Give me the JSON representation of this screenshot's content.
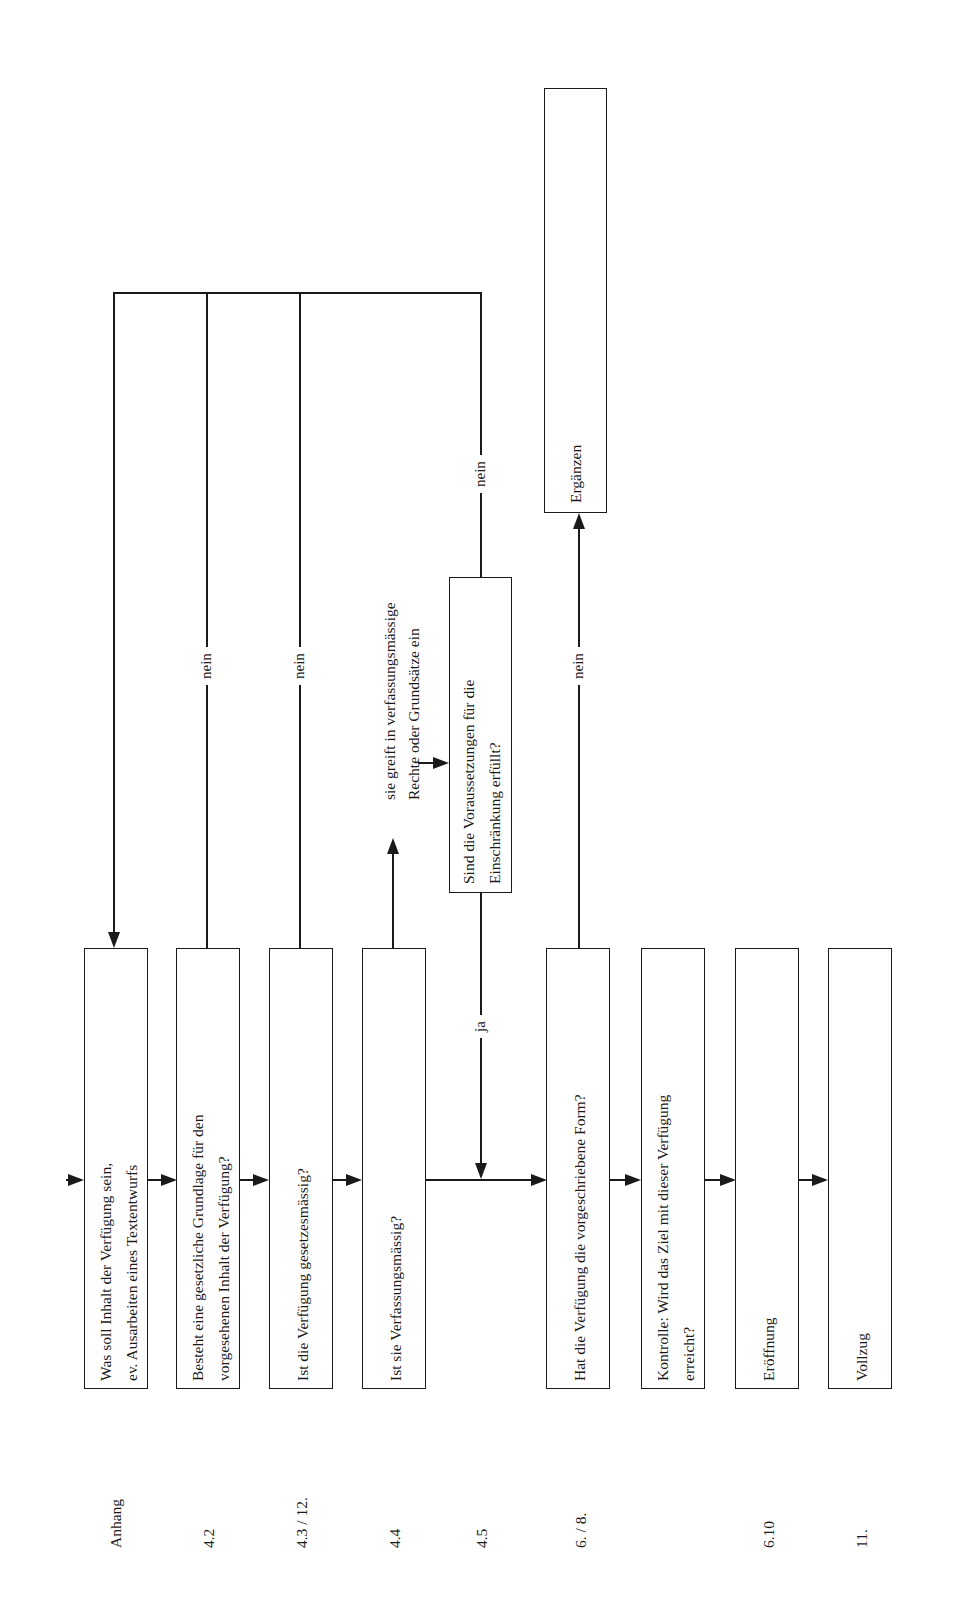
{
  "diagram": {
    "orientation": "rotated-90-ccw",
    "steps": [
      {
        "id": "step1",
        "ref": "Anhang",
        "lines": [
          "Was soll Inhalt der Verfügung sein,",
          "ev. Ausarbeiten eines Textentwurfs"
        ]
      },
      {
        "id": "step2",
        "ref": "4.2",
        "lines": [
          "Besteht eine gesetzliche Grundlage für den",
          "vorgesehenen Inhalt der Verfügung?"
        ]
      },
      {
        "id": "step3",
        "ref": "4.3 / 12.",
        "lines": [
          "Ist die Verfügung gesetzesmässig?"
        ]
      },
      {
        "id": "step4",
        "ref": "4.4",
        "lines": [
          "Ist sie Verfassungsmässig?"
        ]
      },
      {
        "id": "step5",
        "ref": "4.5",
        "lines": []
      },
      {
        "id": "step6",
        "ref": "6. / 8.",
        "lines": [
          "Hat die Verfügung die vorgeschriebene Form?"
        ]
      },
      {
        "id": "step7",
        "ref": "",
        "lines": [
          "Kontrolle: Wird das Ziel mit dieser Verfügung",
          "erreicht?"
        ]
      },
      {
        "id": "step8",
        "ref": "6.10",
        "lines": [
          "Eröffnung"
        ]
      },
      {
        "id": "step9",
        "ref": "11.",
        "lines": [
          "Vollzug"
        ]
      }
    ],
    "side_boxes": {
      "voraussetzungen": {
        "lines": [
          "Sind die Voraussetzungen für die",
          "Einschränkung erfüllt?"
        ]
      },
      "ergaenzen": {
        "lines": [
          "Ergänzen"
        ]
      }
    },
    "annotations": {
      "eingriff": {
        "lines": [
          "sie greift in verfassungsmässige",
          "Rechte oder Grundsätze ein"
        ]
      }
    },
    "edge_labels": {
      "no": "nein",
      "yes": "ja"
    }
  }
}
